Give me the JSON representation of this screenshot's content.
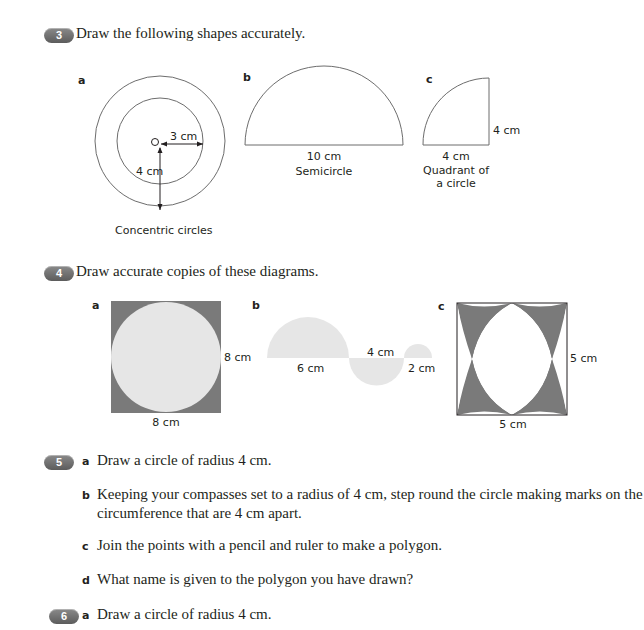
{
  "questions": [
    {
      "number": "3",
      "prompt": "Draw the following shapes accurately.",
      "figures": {
        "a": {
          "part": "a",
          "radius_inner": "3 cm",
          "radius_outer": "4 cm",
          "center_label": "O",
          "caption": "Concentric circles"
        },
        "b": {
          "part": "b",
          "diameter": "10 cm",
          "caption": "Semicircle"
        },
        "c": {
          "part": "c",
          "side_vertical": "4 cm",
          "side_horizontal": "4 cm",
          "caption_line1": "Quadrant of",
          "caption_line2": "a circle"
        }
      }
    },
    {
      "number": "4",
      "prompt": "Draw accurate copies of these diagrams.",
      "figures": {
        "a": {
          "part": "a",
          "side_right": "8 cm",
          "side_bottom": "8 cm"
        },
        "b": {
          "part": "b",
          "label_large": "6 cm",
          "label_medium": "4 cm",
          "label_small": "2 cm"
        },
        "c": {
          "part": "c",
          "side_right": "5 cm",
          "side_bottom": "5 cm"
        }
      }
    },
    {
      "number": "5",
      "parts": [
        {
          "letter": "a",
          "text": "Draw a circle of radius 4 cm."
        },
        {
          "letter": "b",
          "text_line1": "Keeping your compasses set to a radius of 4 cm, step round the circle making marks on the",
          "text_line2": "circumference that are 4 cm apart."
        },
        {
          "letter": "c",
          "text": "Join the points with a pencil and ruler to make a polygon."
        },
        {
          "letter": "d",
          "text": "What name is given to the polygon you have drawn?"
        }
      ]
    },
    {
      "number": "6",
      "parts": [
        {
          "letter": "a",
          "text": "Draw a circle of radius 4 cm."
        }
      ]
    }
  ],
  "colors": {
    "badge": "#6e6e6e",
    "shade_dark": "#7a7a7a",
    "shade_light": "#e6e6e6",
    "line": "#6d6d6d"
  }
}
